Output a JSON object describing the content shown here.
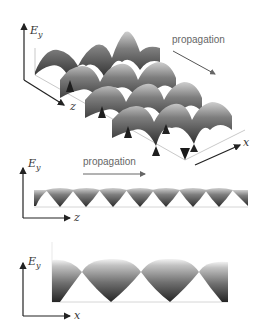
{
  "figure": {
    "panels": [
      {
        "id": "3d-view",
        "axes": {
          "vertical": "E",
          "vertical_sub": "y",
          "depth": "z",
          "horizontal": "x"
        },
        "annotation": "propagation",
        "arrow_direction": "down-right"
      },
      {
        "id": "side-view-z",
        "axes": {
          "vertical": "E",
          "vertical_sub": "y",
          "horizontal": "z"
        },
        "annotation": "propagation",
        "arrow_direction": "right",
        "troughs": 8
      },
      {
        "id": "side-view-x",
        "axes": {
          "vertical": "E",
          "vertical_sub": "y",
          "horizontal": "x"
        },
        "troughs": 3
      }
    ],
    "colors": {
      "axis": "#222222",
      "propagation_arrow": "#555555",
      "surface_dark": "#2a2a2a",
      "surface_light": "#f4f4f4",
      "baseline": "#cccccc"
    }
  }
}
